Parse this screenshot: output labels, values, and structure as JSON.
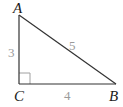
{
  "diagram": {
    "type": "right-triangle",
    "vertices": [
      {
        "label": "A",
        "x": 19,
        "y": 15
      },
      {
        "label": "B",
        "x": 116,
        "y": 84
      },
      {
        "label": "C",
        "x": 19,
        "y": 84
      }
    ],
    "sides": [
      {
        "between": "AC",
        "length_label": "3"
      },
      {
        "between": "CB",
        "length_label": "4"
      },
      {
        "between": "AB",
        "length_label": "5"
      }
    ],
    "right_angle_at": "C",
    "colors": {
      "line": "#333333",
      "vertex_label": "#1a1a1a",
      "side_label": "#9a9a9a",
      "right_angle_marker": "#9a9a9a"
    }
  }
}
